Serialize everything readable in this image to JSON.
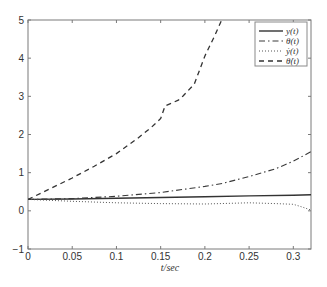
{
  "chart_data": {
    "type": "line",
    "title": "",
    "xlabel": "t/sec",
    "ylabel": "",
    "xlim": [
      0,
      0.32
    ],
    "ylim": [
      -1,
      5
    ],
    "grid": false,
    "legend_position": "upper right",
    "xticks": [
      0,
      0.05,
      0.1,
      0.15,
      0.2,
      0.25,
      0.3
    ],
    "xtick_labels": [
      "0",
      "0.05",
      "0.1",
      "0.15",
      "0.2",
      "0.25",
      "0.3"
    ],
    "yticks": [
      -1,
      0,
      1,
      2,
      3,
      4,
      5
    ],
    "ytick_labels": [
      "−1",
      "0",
      "1",
      "2",
      "3",
      "4",
      "5"
    ],
    "series": [
      {
        "name": "y(t)",
        "style": "solid",
        "x": [
          0,
          0.05,
          0.1,
          0.15,
          0.2,
          0.25,
          0.3,
          0.32
        ],
        "y": [
          0.3,
          0.31,
          0.33,
          0.35,
          0.37,
          0.39,
          0.41,
          0.42
        ]
      },
      {
        "name": "θ(t)",
        "style": "dashdot",
        "x": [
          0,
          0.05,
          0.1,
          0.15,
          0.2,
          0.22,
          0.25,
          0.28,
          0.3,
          0.32
        ],
        "y": [
          0.3,
          0.32,
          0.38,
          0.48,
          0.64,
          0.72,
          0.9,
          1.1,
          1.3,
          1.55
        ]
      },
      {
        "name": "ẏ(t)",
        "style": "dotted",
        "x": [
          0,
          0.05,
          0.1,
          0.15,
          0.2,
          0.25,
          0.28,
          0.3,
          0.31,
          0.32
        ],
        "y": [
          0.3,
          0.25,
          0.21,
          0.19,
          0.18,
          0.21,
          0.19,
          0.17,
          0.1,
          0.02
        ]
      },
      {
        "name": "θ̇(t)",
        "style": "dashed",
        "x": [
          0,
          0.025,
          0.05,
          0.075,
          0.1,
          0.124,
          0.14,
          0.15,
          0.155,
          0.17,
          0.175,
          0.188,
          0.2,
          0.211,
          0.219
        ],
        "y": [
          0.3,
          0.58,
          0.86,
          1.17,
          1.5,
          1.9,
          2.2,
          2.42,
          2.75,
          2.9,
          3.0,
          3.32,
          4.06,
          4.58,
          5.0
        ]
      }
    ]
  }
}
